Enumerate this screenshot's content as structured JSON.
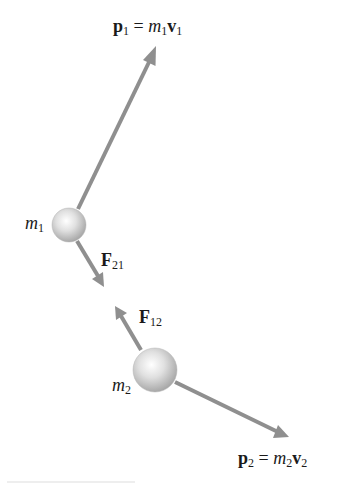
{
  "diagram": {
    "type": "two-particle momentum and interaction force diagram",
    "colors": {
      "arrow": "#8f8f8f",
      "sphere_light": "#ffffff",
      "sphere_mid": "#d9d9d9",
      "sphere_dark": "#a6a6a6",
      "text": "#1a1a1a"
    },
    "particles": [
      {
        "id": "m1",
        "label_sym": "m",
        "label_sub": "1",
        "cx": 69,
        "cy": 225,
        "r": 17
      },
      {
        "id": "m2",
        "label_sym": "m",
        "label_sub": "2",
        "cx": 155,
        "cy": 370,
        "r": 22
      }
    ],
    "arrows": [
      {
        "id": "p1",
        "from": [
          78,
          209
        ],
        "to": [
          156,
          47
        ]
      },
      {
        "id": "F21",
        "from": [
          77,
          241
        ],
        "to": [
          103,
          286
        ]
      },
      {
        "id": "F12",
        "from": [
          141,
          350
        ],
        "to": [
          116,
          307
        ]
      },
      {
        "id": "p2",
        "from": [
          175,
          382
        ],
        "to": [
          288,
          437
        ]
      }
    ],
    "labels": {
      "p1": {
        "vec": "p",
        "vec_sub": "1",
        "eq": "=",
        "mass": "m",
        "mass_sub": "1",
        "vel": "v",
        "vel_sub": "1"
      },
      "p2": {
        "vec": "p",
        "vec_sub": "2",
        "eq": "=",
        "mass": "m",
        "mass_sub": "2",
        "vel": "v",
        "vel_sub": "2"
      },
      "F21": {
        "vec": "F",
        "vec_sub": "21"
      },
      "F12": {
        "vec": "F",
        "vec_sub": "12"
      },
      "m1": {
        "sym": "m",
        "sub": "1"
      },
      "m2": {
        "sym": "m",
        "sub": "2"
      }
    }
  }
}
